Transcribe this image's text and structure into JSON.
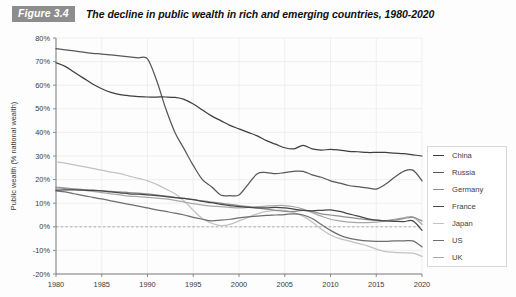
{
  "figure": {
    "badge": "Figure 3.4",
    "title": "The decline in public wealth in rich and emerging countries, 1980-2020"
  },
  "axes": {
    "ylabel": "Public wealth (% national wealth)",
    "xlabel": "",
    "yticks": [
      "80%",
      "70%",
      "60%",
      "50%",
      "40%",
      "30%",
      "20%",
      "10%",
      "0%",
      "-10%",
      "-20%"
    ],
    "xticks": [
      "1980",
      "1985",
      "1990",
      "1995",
      "2000",
      "2005",
      "2010",
      "2015",
      "2020"
    ]
  },
  "legend": {
    "position": "right",
    "items": [
      {
        "label": "China",
        "color": "#3f3f3f"
      },
      {
        "label": "Russia",
        "color": "#575757"
      },
      {
        "label": "Germany",
        "color": "#8f8f8f"
      },
      {
        "label": "France",
        "color": "#474747"
      },
      {
        "label": "Japan",
        "color": "#c2c2c2"
      },
      {
        "label": "US",
        "color": "#6e6e6e"
      },
      {
        "label": "UK",
        "color": "#a8a8a8"
      }
    ]
  },
  "chart_data": {
    "type": "line",
    "title": "The decline in public wealth in rich and emerging countries, 1980-2020",
    "xlabel": "",
    "ylabel": "Public wealth (% national wealth)",
    "xlim": [
      1980,
      2020
    ],
    "ylim": [
      -20,
      80
    ],
    "grid": true,
    "legend_position": "right",
    "x": [
      1980,
      1981,
      1982,
      1983,
      1984,
      1985,
      1986,
      1987,
      1988,
      1989,
      1990,
      1991,
      1992,
      1993,
      1994,
      1995,
      1996,
      1997,
      1998,
      1999,
      2000,
      2001,
      2002,
      2003,
      2004,
      2005,
      2006,
      2007,
      2008,
      2009,
      2010,
      2011,
      2012,
      2013,
      2014,
      2015,
      2016,
      2017,
      2018,
      2019,
      2020
    ],
    "series": [
      {
        "name": "China",
        "color": "#3f3f3f",
        "values": [
          69.5,
          68.0,
          65.5,
          63.0,
          60.5,
          58.5,
          57.0,
          56.0,
          55.5,
          55.2,
          55.0,
          55.0,
          55.0,
          54.8,
          54.0,
          52.0,
          49.5,
          47.0,
          45.0,
          43.0,
          41.5,
          40.0,
          38.5,
          36.5,
          35.0,
          33.5,
          33.0,
          34.5,
          33.0,
          32.5,
          32.8,
          32.5,
          32.0,
          31.8,
          31.5,
          31.5,
          31.5,
          31.2,
          31.0,
          30.5,
          30.0
        ]
      },
      {
        "name": "Russia",
        "color": "#575757",
        "values": [
          75.5,
          75.0,
          74.5,
          74.0,
          73.5,
          73.2,
          72.8,
          72.4,
          72.0,
          71.6,
          71.2,
          62.0,
          50.0,
          40.0,
          33.0,
          26.0,
          20.0,
          17.0,
          13.5,
          13.2,
          13.5,
          18.0,
          22.5,
          23.0,
          22.5,
          23.0,
          23.5,
          23.5,
          22.0,
          21.0,
          19.5,
          18.5,
          17.5,
          17.0,
          16.5,
          16.0,
          18.0,
          21.0,
          23.5,
          24.0,
          19.5
        ]
      },
      {
        "name": "Germany",
        "color": "#8f8f8f",
        "values": [
          16.5,
          16.2,
          16.0,
          15.8,
          15.5,
          15.2,
          15.0,
          14.8,
          14.5,
          14.3,
          14.0,
          13.5,
          13.0,
          12.5,
          12.0,
          11.5,
          11.0,
          10.5,
          10.0,
          9.5,
          9.0,
          8.5,
          8.0,
          7.5,
          7.0,
          6.5,
          6.5,
          7.0,
          6.5,
          5.5,
          5.0,
          4.5,
          4.0,
          3.5,
          3.0,
          2.8,
          2.6,
          2.8,
          3.5,
          4.0,
          2.5
        ]
      },
      {
        "name": "France",
        "color": "#474747",
        "values": [
          15.5,
          15.6,
          15.6,
          15.5,
          15.4,
          15.2,
          14.8,
          14.4,
          14.0,
          13.8,
          13.5,
          13.2,
          12.8,
          12.4,
          12.0,
          11.5,
          10.8,
          10.2,
          9.5,
          9.0,
          8.5,
          8.2,
          8.0,
          8.0,
          8.2,
          8.0,
          7.5,
          7.0,
          6.8,
          7.0,
          7.2,
          6.5,
          5.5,
          4.5,
          3.5,
          2.8,
          2.5,
          2.3,
          2.2,
          2.5,
          -1.5
        ]
      },
      {
        "name": "Japan",
        "color": "#c2c2c2",
        "values": [
          27.5,
          27.0,
          26.2,
          25.5,
          24.8,
          24.0,
          23.2,
          22.5,
          21.5,
          20.5,
          19.5,
          18.0,
          16.0,
          14.0,
          11.0,
          7.0,
          3.5,
          1.5,
          0.5,
          1.0,
          2.5,
          4.0,
          5.5,
          6.5,
          7.0,
          7.0,
          6.0,
          4.5,
          2.0,
          -1.0,
          -3.5,
          -5.0,
          -6.0,
          -7.0,
          -8.0,
          -9.5,
          -10.5,
          -10.8,
          -11.0,
          -11.2,
          -12.5
        ]
      },
      {
        "name": "US",
        "color": "#6e6e6e",
        "values": [
          15.2,
          14.8,
          14.0,
          13.2,
          12.5,
          11.8,
          11.0,
          10.2,
          9.5,
          8.8,
          8.0,
          7.2,
          6.5,
          5.8,
          5.0,
          4.0,
          3.2,
          2.5,
          2.8,
          3.2,
          3.8,
          4.2,
          4.5,
          4.8,
          5.0,
          5.2,
          5.5,
          5.0,
          3.5,
          1.0,
          -1.5,
          -3.5,
          -4.8,
          -5.5,
          -6.0,
          -6.2,
          -6.2,
          -6.0,
          -6.0,
          -6.0,
          -8.5
        ]
      },
      {
        "name": "UK",
        "color": "#a8a8a8",
        "values": [
          16.8,
          16.5,
          16.0,
          15.5,
          15.0,
          14.5,
          14.0,
          13.5,
          13.0,
          12.8,
          12.5,
          12.2,
          11.8,
          11.2,
          10.5,
          9.8,
          9.2,
          8.8,
          8.5,
          8.2,
          8.0,
          8.2,
          8.5,
          8.8,
          9.0,
          9.0,
          8.5,
          7.5,
          6.0,
          4.5,
          3.2,
          2.5,
          2.0,
          1.8,
          1.8,
          2.0,
          2.5,
          3.2,
          3.8,
          4.2,
          1.0
        ]
      }
    ]
  }
}
